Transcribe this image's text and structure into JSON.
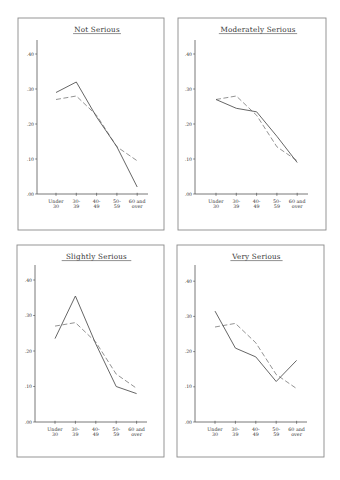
{
  "page": {
    "layout": "2x2 grid of line charts",
    "colors": {
      "frame": "#8a8a8a",
      "axis": "#555555",
      "solid_line": "#555555",
      "dashed_line": "#777777",
      "text": "#333333"
    }
  },
  "axes": {
    "y_ticks": [
      0.0,
      0.1,
      0.2,
      0.3,
      0.4
    ],
    "y_tick_labels": [
      ".00",
      ".10",
      ".20",
      ".30",
      ".40"
    ],
    "x_tick_labels": [
      [
        "Under",
        "30"
      ],
      [
        "30-",
        "39"
      ],
      [
        "40-",
        "49"
      ],
      [
        "50-",
        "59"
      ],
      [
        "60 and",
        "over"
      ]
    ]
  },
  "chart_data": [
    {
      "type": "line",
      "title": "Not Serious",
      "categories": [
        "Under 30",
        "30-39",
        "40-49",
        "50-59",
        "60 and over"
      ],
      "series": [
        {
          "name": "category",
          "style": "solid",
          "values": [
            0.29,
            0.32,
            0.22,
            0.135,
            0.02
          ]
        },
        {
          "name": "overall",
          "style": "dashed",
          "values": [
            0.27,
            0.28,
            0.225,
            0.135,
            0.095
          ]
        }
      ],
      "xlabel": "",
      "ylabel": "",
      "ylim": [
        0,
        0.44
      ],
      "grid": false,
      "legend": "none",
      "frame": {
        "x": 18,
        "y": 18,
        "w": 146,
        "h": 212
      },
      "plot": {
        "x0": 37,
        "y0": 194,
        "xstart": 56,
        "xstep": 20.3,
        "xend": 148,
        "ytop": 40,
        "pxPerUnit": 350
      }
    },
    {
      "type": "line",
      "title": "Moderately Serious",
      "categories": [
        "Under 30",
        "30-39",
        "40-49",
        "50-59",
        "60 and over"
      ],
      "series": [
        {
          "name": "category",
          "style": "solid",
          "values": [
            0.27,
            0.245,
            0.235,
            0.165,
            0.09
          ]
        },
        {
          "name": "overall",
          "style": "dashed",
          "values": [
            0.27,
            0.28,
            0.225,
            0.135,
            0.095
          ]
        }
      ],
      "xlabel": "",
      "ylabel": "",
      "ylim": [
        0,
        0.44
      ],
      "grid": false,
      "legend": "none",
      "frame": {
        "x": 178,
        "y": 18,
        "w": 148,
        "h": 212
      },
      "plot": {
        "x0": 195,
        "y0": 194,
        "xstart": 216,
        "xstep": 20.3,
        "xend": 308,
        "ytop": 40,
        "pxPerUnit": 350
      }
    },
    {
      "type": "line",
      "title": "Slightly Serious",
      "categories": [
        "Under 30",
        "30-39",
        "40-49",
        "50-59",
        "60 and over"
      ],
      "series": [
        {
          "name": "category",
          "style": "solid",
          "values": [
            0.235,
            0.355,
            0.22,
            0.1,
            0.08
          ]
        },
        {
          "name": "overall",
          "style": "dashed",
          "values": [
            0.27,
            0.28,
            0.225,
            0.135,
            0.095
          ]
        }
      ],
      "xlabel": "",
      "ylabel": "",
      "ylim": [
        0,
        0.44
      ],
      "grid": false,
      "legend": "none",
      "frame": {
        "x": 17,
        "y": 245,
        "w": 147,
        "h": 212
      },
      "plot": {
        "x0": 35,
        "y0": 422,
        "xstart": 55,
        "xstep": 20.4,
        "xend": 147,
        "ytop": 265,
        "pxPerUnit": 355
      }
    },
    {
      "type": "line",
      "title": "Very Serious",
      "categories": [
        "Under 30",
        "30-39",
        "40-49",
        "50-59",
        "60 and over"
      ],
      "series": [
        {
          "name": "category",
          "style": "solid",
          "values": [
            0.315,
            0.21,
            0.185,
            0.115,
            0.175
          ]
        },
        {
          "name": "overall",
          "style": "dashed",
          "values": [
            0.27,
            0.28,
            0.225,
            0.135,
            0.095
          ]
        }
      ],
      "xlabel": "",
      "ylabel": "",
      "ylim": [
        0,
        0.44
      ],
      "grid": false,
      "legend": "none",
      "frame": {
        "x": 177,
        "y": 245,
        "w": 147,
        "h": 212
      },
      "plot": {
        "x0": 195,
        "y0": 422,
        "xstart": 215,
        "xstep": 20.4,
        "xend": 307,
        "ytop": 265,
        "pxPerUnit": 352
      }
    }
  ]
}
